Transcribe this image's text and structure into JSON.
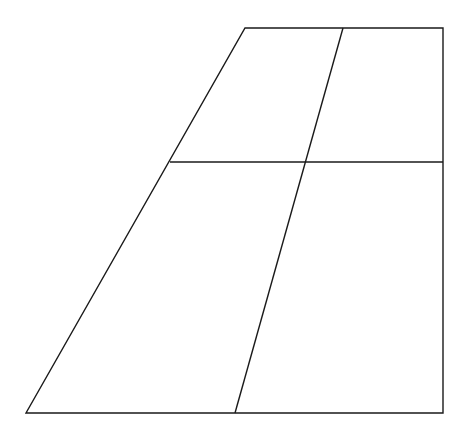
{
  "diagram": {
    "type": "trapezoid-divided-into-four",
    "stroke_color": "#1a1a1a",
    "background": "#ffffff",
    "outline": {
      "top_left": [
        245,
        28
      ],
      "top_right": [
        443,
        28
      ],
      "bottom_right": [
        443,
        413
      ],
      "bottom_left": [
        26,
        413
      ]
    },
    "horizontal_divider": {
      "from": [
        170,
        162
      ],
      "to": [
        443,
        162
      ]
    },
    "slanted_divider": {
      "from": [
        343,
        28
      ],
      "to": [
        235,
        413
      ]
    },
    "labels": []
  }
}
